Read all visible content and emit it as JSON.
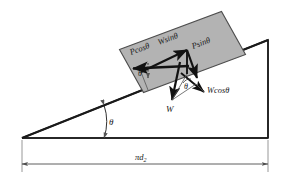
{
  "figure": {
    "background_color": "#ffffff",
    "line_color": "#1a1a1a",
    "block_fill_color": "#b3b3b3",
    "block_stroke_color": "#4d4d4d",
    "dimension_line_color": "#808080"
  },
  "incline": {
    "name": "inclined-plane-triangle",
    "base_left_x": 22,
    "base_right_x": 268,
    "base_y": 138,
    "apex_x": 268,
    "apex_y": 40,
    "angle_label": "θ"
  },
  "block": {
    "name": "block-on-incline",
    "fill": "#b3b3b3",
    "rotation_deg": -21
  },
  "vectors": [
    {
      "name": "p-cos-theta-vector",
      "label": "Pcosθ",
      "direction": "up-slope-left"
    },
    {
      "name": "w-sin-theta-vector",
      "label": "Wsinθ",
      "direction": "up-slope-right"
    },
    {
      "name": "p-sin-theta-vector",
      "label": "Psinθ",
      "direction": "down-right-normal"
    },
    {
      "name": "w-cos-theta-vector",
      "label": "Wcosθ",
      "direction": "down-right-perpendicular"
    },
    {
      "name": "weight-vector",
      "label": "W",
      "direction": "vertical-down"
    }
  ],
  "angles": [
    {
      "name": "incline-base-angle",
      "label": "θ"
    },
    {
      "name": "block-upper-angle",
      "label": "θ"
    },
    {
      "name": "block-lower-angle",
      "label": "θ"
    }
  ],
  "dimension": {
    "name": "base-dimension",
    "label": "πd₂",
    "label_main": "πd",
    "label_sub": "2"
  }
}
